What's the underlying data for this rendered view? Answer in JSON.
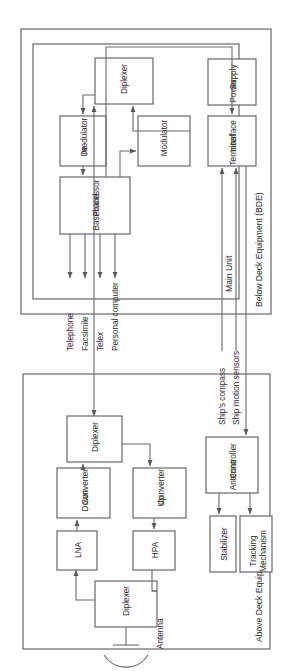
{
  "diagram": {
    "orientation": "rotated-90-ccw",
    "colors": {
      "background": "#ffffff",
      "stroke": "#5a5a5a",
      "line": "#6b6b6b",
      "text": "#2b2b2b"
    },
    "sections": [
      {
        "id": "bde",
        "label": "Below Deck Equipment (BDE)"
      },
      {
        "id": "ade",
        "label": "Above Deck Equipment (ADE)"
      }
    ],
    "subsections": [
      {
        "id": "main-unit",
        "label": "Main Unit"
      }
    ],
    "blocks": {
      "baseband_processor": "Baseband\nProcessor",
      "baseband_processor_l1": "Baseband",
      "baseband_processor_l2": "Processor",
      "demodulator_l1": "De-",
      "demodulator_l2": "modulator",
      "modulator": "Modulator",
      "diplexer_bde": "Diplexer",
      "terminal_interface_l1": "Terminal",
      "terminal_interface_l2": "Interface",
      "power_supply_l1": "Power",
      "power_supply_l2": "Supply",
      "diplexer_ade_top": "Diplexer",
      "diplexer_ade_bottom": "Diplexer",
      "down_converter_l1": "Down",
      "down_converter_l2": "Converter",
      "up_converter_l1": "Up",
      "up_converter_l2": "Converter",
      "lna": "LNA",
      "hpa": "HPA",
      "antenna_controller_l1": "Antenna",
      "antenna_controller_l2": "Controller",
      "stabilizer": "Stabilizer",
      "tracking_mechanism_l1": "Tracking",
      "tracking_mechanism_l2": "Mechanism",
      "antenna": "Antenna"
    },
    "external_outputs": [
      "Telephone",
      "Facsimile",
      "Telex",
      "Personal computer"
    ],
    "external_inputs": [
      "Ship's compass",
      "Ship motion sensors"
    ]
  }
}
